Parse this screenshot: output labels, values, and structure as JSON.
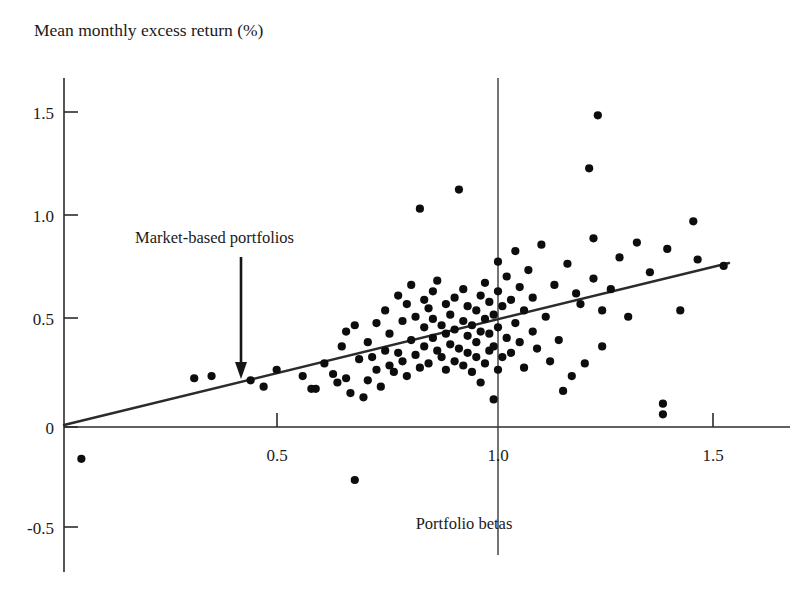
{
  "figure": {
    "title_y": "Mean monthly excess return (%)",
    "title_x": "Portfolio betas",
    "annotation": "Market-based portfolios"
  },
  "axes": {
    "y_ticks": [
      "1.5",
      "1.0",
      "0.5",
      "0",
      "-0.5"
    ],
    "x_ticks": [
      "0.5",
      "1.0",
      "1.5"
    ]
  },
  "colors": {
    "point": "#0d0d0d",
    "axis": "#2b2b2b",
    "line": "#2b2b2b",
    "background": "#ffffff",
    "text": "#1a1a1a"
  },
  "chart_data": {
    "type": "scatter",
    "title": "",
    "xlabel": "Portfolio betas",
    "ylabel": "Mean monthly excess return (%)",
    "xlim": [
      -0.05,
      1.72
    ],
    "ylim": [
      -0.72,
      1.78
    ],
    "xticks": [
      0.5,
      1.0,
      1.5
    ],
    "yticks": [
      -0.5,
      0,
      0.5,
      1.0,
      1.5
    ],
    "grid": false,
    "legend": null,
    "annotations": [
      {
        "text": "Market-based portfolios",
        "x": 0.41,
        "y": 0.9,
        "arrow_to_x": 0.41,
        "arrow_to_y": 0.27
      }
    ],
    "reference_lines": [
      {
        "name": "security-market-line",
        "type": "line",
        "from": [
          0.0,
          0.0
        ],
        "to": [
          1.55,
          0.79
        ],
        "slope": 0.51,
        "intercept": 0.0
      },
      {
        "name": "beta-one-vertical",
        "type": "vline",
        "x": 1.0,
        "from_y": -0.62,
        "to_y": 1.72
      }
    ],
    "series": [
      {
        "name": "Market-based portfolios",
        "marker": "circle",
        "color": "#0d0d0d",
        "x": [
          0.04,
          0.3,
          0.34,
          0.43,
          0.46,
          0.49,
          0.55,
          0.57,
          0.58,
          0.6,
          0.62,
          0.63,
          0.64,
          0.65,
          0.65,
          0.66,
          0.67,
          0.67,
          0.68,
          0.69,
          0.7,
          0.7,
          0.71,
          0.72,
          0.72,
          0.73,
          0.74,
          0.74,
          0.75,
          0.75,
          0.76,
          0.77,
          0.77,
          0.78,
          0.78,
          0.79,
          0.79,
          0.8,
          0.8,
          0.81,
          0.81,
          0.82,
          0.82,
          0.83,
          0.83,
          0.83,
          0.84,
          0.84,
          0.85,
          0.85,
          0.85,
          0.86,
          0.86,
          0.87,
          0.87,
          0.88,
          0.88,
          0.88,
          0.89,
          0.89,
          0.9,
          0.9,
          0.9,
          0.91,
          0.91,
          0.92,
          0.92,
          0.92,
          0.93,
          0.93,
          0.93,
          0.94,
          0.94,
          0.95,
          0.95,
          0.95,
          0.96,
          0.96,
          0.96,
          0.97,
          0.97,
          0.97,
          0.98,
          0.98,
          0.98,
          0.99,
          0.99,
          0.99,
          1.0,
          1.0,
          1.0,
          1.0,
          1.01,
          1.01,
          1.02,
          1.02,
          1.03,
          1.03,
          1.04,
          1.04,
          1.05,
          1.05,
          1.06,
          1.06,
          1.07,
          1.08,
          1.08,
          1.09,
          1.1,
          1.11,
          1.12,
          1.13,
          1.14,
          1.15,
          1.16,
          1.17,
          1.18,
          1.19,
          1.2,
          1.21,
          1.22,
          1.22,
          1.23,
          1.24,
          1.24,
          1.26,
          1.28,
          1.3,
          1.32,
          1.35,
          1.38,
          1.38,
          1.39,
          1.42,
          1.45,
          1.46,
          1.52
        ],
        "y": [
          -0.15,
          0.23,
          0.24,
          0.22,
          0.19,
          0.27,
          0.24,
          0.18,
          0.18,
          0.3,
          0.25,
          0.21,
          0.38,
          0.23,
          0.45,
          0.16,
          -0.25,
          0.48,
          0.32,
          0.14,
          0.22,
          0.4,
          0.33,
          0.27,
          0.49,
          0.19,
          0.36,
          0.55,
          0.29,
          0.44,
          0.26,
          0.35,
          0.62,
          0.31,
          0.5,
          0.24,
          0.58,
          0.41,
          0.67,
          0.34,
          0.52,
          0.28,
          1.03,
          0.38,
          0.47,
          0.6,
          0.3,
          0.56,
          0.42,
          0.51,
          0.64,
          0.36,
          0.69,
          0.33,
          0.48,
          0.27,
          0.44,
          0.58,
          0.39,
          0.53,
          0.31,
          0.46,
          0.61,
          1.12,
          0.37,
          0.29,
          0.5,
          0.65,
          0.35,
          0.43,
          0.57,
          0.26,
          0.48,
          0.33,
          0.4,
          0.55,
          0.21,
          0.45,
          0.62,
          0.3,
          0.51,
          0.68,
          0.36,
          0.44,
          0.59,
          0.13,
          0.38,
          0.53,
          0.27,
          0.47,
          0.64,
          0.78,
          0.33,
          0.57,
          0.42,
          0.71,
          0.35,
          0.6,
          0.49,
          0.83,
          0.4,
          0.66,
          0.28,
          0.55,
          0.74,
          0.45,
          0.61,
          0.37,
          0.86,
          0.52,
          0.31,
          0.67,
          0.41,
          0.17,
          0.77,
          0.24,
          0.63,
          0.58,
          0.3,
          1.22,
          0.89,
          0.7,
          1.47,
          0.55,
          0.38,
          0.65,
          0.8,
          0.52,
          0.87,
          0.73,
          0.06,
          0.11,
          0.84,
          0.55,
          0.97,
          0.79,
          0.76
        ]
      }
    ]
  }
}
